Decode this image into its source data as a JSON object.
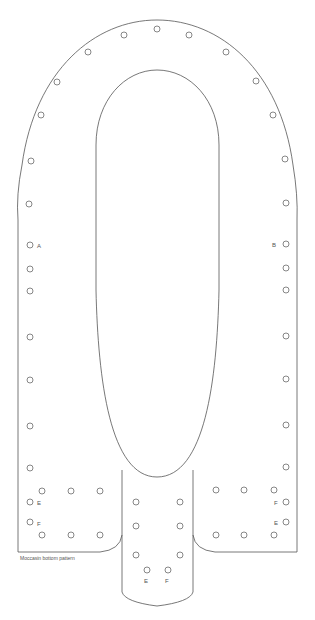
{
  "diagram": {
    "caption": "Moccasin bottom pattern",
    "stroke_color": "#555555",
    "labels": {
      "A": "A",
      "B": "B",
      "E": "E",
      "F": "F"
    },
    "holes": {
      "outer_arc": [
        [
          41,
          115
        ],
        [
          57,
          82
        ],
        [
          88,
          52
        ],
        [
          124,
          35
        ],
        [
          157,
          29
        ],
        [
          189,
          35
        ],
        [
          226,
          52
        ],
        [
          256,
          81
        ],
        [
          273,
          115
        ],
        [
          31,
          161
        ],
        [
          285,
          159
        ],
        [
          29,
          204
        ],
        [
          286,
          203
        ]
      ],
      "left_column": [
        [
          30,
          245
        ],
        [
          30,
          269
        ],
        [
          30,
          291
        ],
        [
          30,
          337
        ],
        [
          30,
          380
        ],
        [
          30,
          426
        ],
        [
          30,
          468
        ]
      ],
      "right_column": [
        [
          286,
          244
        ],
        [
          286,
          268
        ],
        [
          286,
          290
        ],
        [
          286,
          336
        ],
        [
          286,
          379
        ],
        [
          286,
          425
        ],
        [
          286,
          467
        ]
      ],
      "left_panel": [
        [
          42,
          491
        ],
        [
          71,
          491
        ],
        [
          100,
          491
        ],
        [
          30,
          502
        ],
        [
          30,
          522
        ],
        [
          42,
          535
        ],
        [
          71,
          535
        ],
        [
          100,
          535
        ]
      ],
      "right_panel": [
        [
          216,
          490
        ],
        [
          244,
          490
        ],
        [
          274,
          490
        ],
        [
          286,
          502
        ],
        [
          286,
          522
        ],
        [
          216,
          535
        ],
        [
          244,
          535
        ],
        [
          274,
          535
        ]
      ],
      "tongue": [
        [
          136,
          502
        ],
        [
          180,
          502
        ],
        [
          136,
          526
        ],
        [
          180,
          526
        ],
        [
          136,
          555
        ],
        [
          180,
          555
        ],
        [
          147,
          570
        ],
        [
          168,
          570
        ]
      ]
    },
    "hole_labels": [
      {
        "text": "A",
        "x": 37,
        "y": 248
      },
      {
        "text": "B",
        "x": 272,
        "y": 247
      },
      {
        "text": "E",
        "x": 37,
        "y": 505
      },
      {
        "text": "F",
        "x": 37,
        "y": 526
      },
      {
        "text": "F",
        "x": 274,
        "y": 505
      },
      {
        "text": "E",
        "x": 274,
        "y": 525
      },
      {
        "text": "E",
        "x": 144,
        "y": 583
      },
      {
        "text": "F",
        "x": 165,
        "y": 583
      }
    ]
  }
}
